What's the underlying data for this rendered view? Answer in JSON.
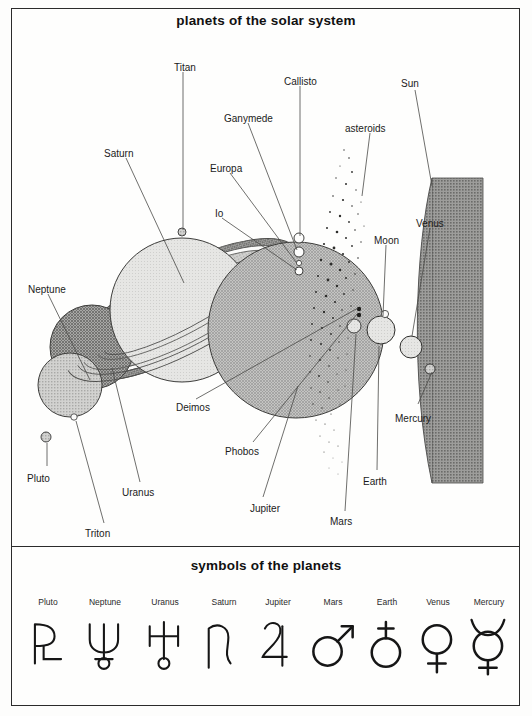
{
  "page": {
    "title_top": "planets of the solar system",
    "title_bottom": "symbols of the planets",
    "background": "#fefefd",
    "ink": "#1b1b1b"
  },
  "diagram": {
    "type": "scale-comparison-diagram",
    "labels": [
      {
        "name": "Titan",
        "text": "Titan",
        "x": 174,
        "y": 63
      },
      {
        "name": "Callisto",
        "text": "Callisto",
        "x": 284,
        "y": 77
      },
      {
        "name": "Sun",
        "text": "Sun",
        "x": 401,
        "y": 79
      },
      {
        "name": "Ganymede",
        "text": "Ganymede",
        "x": 224,
        "y": 114
      },
      {
        "name": "asteroids",
        "text": "asteroids",
        "x": 345,
        "y": 124
      },
      {
        "name": "Saturn",
        "text": "Saturn",
        "x": 104,
        "y": 149
      },
      {
        "name": "Europa",
        "text": "Europa",
        "x": 210,
        "y": 164
      },
      {
        "name": "Io",
        "text": "Io",
        "x": 215,
        "y": 209
      },
      {
        "name": "Venus",
        "text": "Venus",
        "x": 416,
        "y": 219
      },
      {
        "name": "Moon",
        "text": "Moon",
        "x": 374,
        "y": 236
      },
      {
        "name": "Neptune",
        "text": "Neptune",
        "x": 28,
        "y": 285
      },
      {
        "name": "Deimos",
        "text": "Deimos",
        "x": 176,
        "y": 403
      },
      {
        "name": "Mercury",
        "text": "Mercury",
        "x": 395,
        "y": 414
      },
      {
        "name": "Phobos",
        "text": "Phobos",
        "x": 225,
        "y": 447
      },
      {
        "name": "Pluto",
        "text": "Pluto",
        "x": 27,
        "y": 474
      },
      {
        "name": "Earth",
        "text": "Earth",
        "x": 363,
        "y": 477
      },
      {
        "name": "Uranus",
        "text": "Uranus",
        "x": 122,
        "y": 488
      },
      {
        "name": "Jupiter",
        "text": "Jupiter",
        "x": 250,
        "y": 504
      },
      {
        "name": "Mars",
        "text": "Mars",
        "x": 330,
        "y": 517
      },
      {
        "name": "Triton",
        "text": "Triton",
        "x": 85,
        "y": 529
      }
    ],
    "bodies": [
      {
        "name": "sun",
        "kind": "arc-segment",
        "shade": "dark-checker"
      },
      {
        "name": "jupiter",
        "kind": "sphere",
        "cx": 296,
        "cy": 330,
        "r": 88,
        "shade": "medium-hatch"
      },
      {
        "name": "saturn",
        "kind": "sphere",
        "cx": 182,
        "cy": 310,
        "r": 72,
        "shade": "light"
      },
      {
        "name": "saturn-rings",
        "kind": "ellipse-rings"
      },
      {
        "name": "uranus",
        "kind": "sphere",
        "cx": 92,
        "cy": 347,
        "r": 42,
        "shade": "dark-hatch"
      },
      {
        "name": "neptune",
        "kind": "sphere",
        "cx": 70,
        "cy": 385,
        "r": 32,
        "shade": "medium"
      },
      {
        "name": "earth",
        "kind": "sphere",
        "cx": 381,
        "cy": 330,
        "r": 14,
        "shade": "light"
      },
      {
        "name": "venus",
        "kind": "sphere",
        "cx": 411,
        "cy": 346,
        "r": 11,
        "shade": "light"
      },
      {
        "name": "mars",
        "kind": "sphere",
        "cx": 354,
        "cy": 325,
        "r": 7,
        "shade": "light"
      },
      {
        "name": "mercury",
        "kind": "sphere",
        "cx": 431,
        "cy": 368,
        "r": 5,
        "shade": "medium"
      },
      {
        "name": "pluto",
        "kind": "sphere",
        "cx": 46,
        "cy": 437,
        "r": 5,
        "shade": "medium"
      },
      {
        "name": "moon",
        "kind": "sphere",
        "cx": 390,
        "cy": 322,
        "r": 4,
        "shade": "light"
      },
      {
        "name": "titan",
        "kind": "moon",
        "cx": 182,
        "cy": 232,
        "r": 4
      },
      {
        "name": "callisto",
        "kind": "moon",
        "cx": 299,
        "cy": 238,
        "r": 5
      },
      {
        "name": "ganymede",
        "kind": "moon",
        "cx": 299,
        "cy": 252,
        "r": 5
      },
      {
        "name": "europa",
        "kind": "moon",
        "cx": 299,
        "cy": 263,
        "r": 3
      },
      {
        "name": "io",
        "kind": "moon",
        "cx": 299,
        "cy": 270,
        "r": 4
      },
      {
        "name": "triton",
        "kind": "moon",
        "cx": 74,
        "cy": 417,
        "r": 3
      },
      {
        "name": "phobos",
        "kind": "moon",
        "cx": 331,
        "cy": 312,
        "r": 2
      },
      {
        "name": "deimos",
        "kind": "moon",
        "cx": 331,
        "cy": 306,
        "r": 2
      },
      {
        "name": "asteroid-belt",
        "kind": "stipple-band"
      }
    ]
  },
  "symbols": {
    "items": [
      {
        "name": "pluto",
        "label": "Pluto",
        "glyph": "pluto-symbol",
        "cx": 48
      },
      {
        "name": "neptune",
        "label": "Neptune",
        "glyph": "neptune-symbol",
        "cx": 105
      },
      {
        "name": "uranus",
        "label": "Uranus",
        "glyph": "uranus-symbol",
        "cx": 165
      },
      {
        "name": "saturn",
        "label": "Saturn",
        "glyph": "saturn-symbol",
        "cx": 224
      },
      {
        "name": "jupiter",
        "label": "Jupiter",
        "glyph": "jupiter-symbol",
        "cx": 278
      },
      {
        "name": "mars",
        "label": "Mars",
        "glyph": "mars-symbol",
        "cx": 333
      },
      {
        "name": "earth",
        "label": "Earth",
        "glyph": "earth-symbol",
        "cx": 387
      },
      {
        "name": "venus",
        "label": "Venus",
        "glyph": "venus-symbol",
        "cx": 438
      },
      {
        "name": "mercury",
        "label": "Mercury",
        "glyph": "mercury-symbol",
        "cx": 489
      }
    ],
    "label_y": 597,
    "glyph_y": 615
  }
}
